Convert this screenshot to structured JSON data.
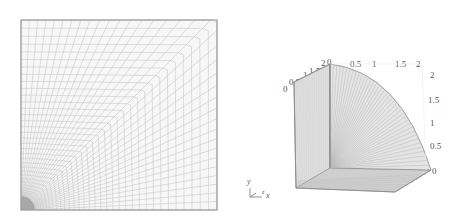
{
  "figure": {
    "left": {
      "title": "",
      "description": "2D quarter plate with hole mesh",
      "colors": {
        "mesh_line": "#c8c8c8",
        "border": "#9a9a9a",
        "hole": "#a8a8a8",
        "fill": "#f7f7f7"
      }
    },
    "right": {
      "description": "3D swept quarter-cylinder mesh",
      "axis_top_ticks": [
        "0",
        "0.5",
        "1",
        "1.5",
        "2"
      ],
      "axis_right_ticks": [
        "2",
        "1.5",
        "1",
        "0.5",
        "0"
      ],
      "axis_left_ticks": [
        "0",
        "0.5",
        "1",
        "1.5",
        "2"
      ],
      "triad": {
        "y_label": "y",
        "x_label": "x",
        "z_label": "z"
      },
      "colors": {
        "surface": "#d6d6d6",
        "edge": "#8c8c8c",
        "mesh_line": "#b9b9b9",
        "shadow": "#c4c4c4"
      }
    }
  }
}
